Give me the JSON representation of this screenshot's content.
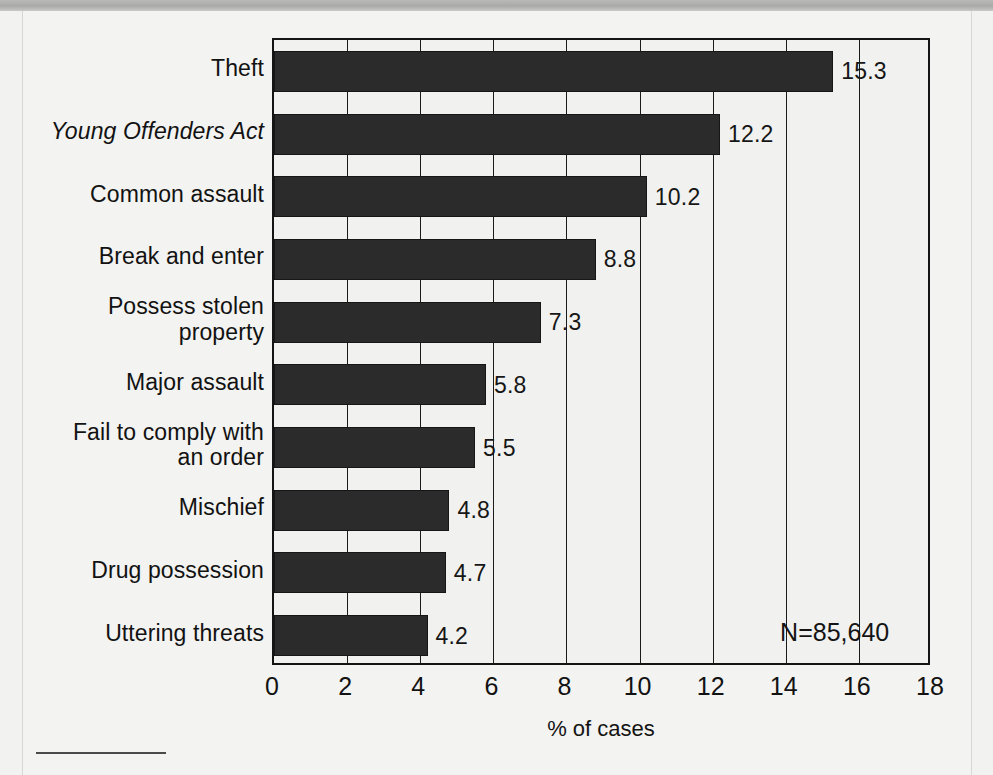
{
  "chart_data": {
    "type": "bar",
    "orientation": "horizontal",
    "title": "",
    "xlabel": "% of cases",
    "ylabel": "",
    "xlim": [
      0,
      18
    ],
    "xticks": [
      "0",
      "2",
      "4",
      "6",
      "8",
      "10",
      "12",
      "14",
      "16",
      "18"
    ],
    "grid": true,
    "legend": "none",
    "categories": [
      "Theft",
      "Young Offenders Act",
      "Common assault",
      "Break and enter",
      "Possess stolen property",
      "Major assault",
      "Fail to comply with an order",
      "Mischief",
      "Drug possession",
      "Uttering threats"
    ],
    "category_lines": [
      [
        "Theft"
      ],
      [
        "Young Offenders Act"
      ],
      [
        "Common assault"
      ],
      [
        "Break and enter"
      ],
      [
        "Possess stolen",
        "property"
      ],
      [
        "Major assault"
      ],
      [
        "Fail to comply with",
        "an order"
      ],
      [
        "Mischief"
      ],
      [
        "Drug possession"
      ],
      [
        "Uttering threats"
      ]
    ],
    "category_italic": [
      false,
      true,
      false,
      false,
      false,
      false,
      false,
      false,
      false,
      false
    ],
    "values": [
      15.3,
      12.2,
      10.2,
      8.8,
      7.3,
      5.8,
      5.5,
      4.8,
      4.7,
      4.2
    ],
    "value_labels": [
      "15.3",
      "12.2",
      "10.2",
      "8.8",
      "7.3",
      "5.8",
      "5.5",
      "4.8",
      "4.7",
      "4.2"
    ],
    "annotation": "N=85,640",
    "bar_color": "#2b2b2b",
    "background_color": "#f1f1ef",
    "axis_color": "#141414"
  }
}
